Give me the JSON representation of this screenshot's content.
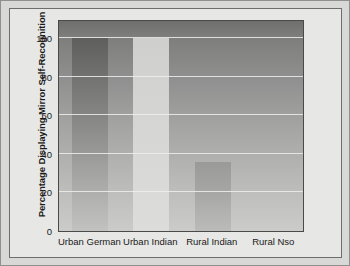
{
  "chart_data": {
    "type": "bar",
    "title": "",
    "subtitle": "",
    "xlabel": "",
    "ylabel": "Percentage Displaying Mirror Self-Recognition",
    "categories": [
      "Urban German",
      "Urban Indian",
      "Rural Indian",
      "Rural Nso"
    ],
    "values": [
      100,
      100,
      36,
      59
    ],
    "series": [
      {
        "name": "Percentage Displaying Mirror Self-Recognition",
        "values": [
          100,
          100,
          36,
          59
        ]
      }
    ],
    "ylim": [
      0,
      110
    ],
    "yticks": [
      0,
      20,
      40,
      60,
      80,
      100
    ],
    "ytick_labels": [
      "0",
      "20",
      "40",
      "60",
      "80",
      "100"
    ],
    "grid": true,
    "gridline_color": "#eeeeec",
    "legend": false,
    "legend_position": "none",
    "bar_colors": [
      "#8d8d8b",
      "#d6d6d4",
      "#a8a8a6",
      "#6a6a68"
    ],
    "plot_background": "#a4a4a2",
    "frame_color": "#4a4a48",
    "annotations": []
  },
  "figure": {
    "border_color": "#6d6d6b",
    "page_background": "#e7e7e5",
    "outer_background": "#d8d8d6"
  }
}
